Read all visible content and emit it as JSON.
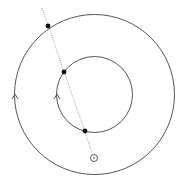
{
  "diagram": {
    "type": "concentric-circles-with-secant",
    "colors": {
      "background": "#ffffff",
      "stroke": "#555555",
      "line": "#888888",
      "point": "#111111"
    },
    "outer_circle": {
      "cx": 94.5,
      "cy": 94.5,
      "r": 80,
      "arrow": {
        "x": 15,
        "y": 95,
        "direction": "up"
      }
    },
    "inner_circle": {
      "cx": 94.5,
      "cy": 94.5,
      "r": 38,
      "arrow": {
        "x": 57,
        "y": 95,
        "direction": "up"
      }
    },
    "secant_line": {
      "x1": 42,
      "y1": 8,
      "x2": 94,
      "y2": 158,
      "style": "dotted"
    },
    "points": [
      {
        "name": "outer-intersection",
        "x": 48,
        "y": 26
      },
      {
        "name": "inner-intersection-upper",
        "x": 64,
        "y": 72
      },
      {
        "name": "inner-intersection-lower",
        "x": 85,
        "y": 131
      }
    ],
    "origin_point": {
      "x": 94,
      "y": 158,
      "r": 3.5
    }
  }
}
